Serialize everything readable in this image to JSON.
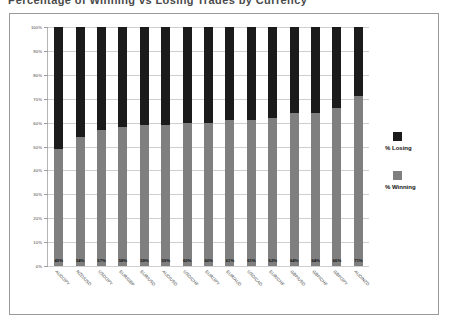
{
  "title_remnant": "Percentage of Winning vs Losing Trades by Currency Pair",
  "chart_data": {
    "type": "bar",
    "subtype": "stacked-bar-100",
    "title": "",
    "xlabel": "",
    "ylabel": "",
    "ylim": [
      0,
      100
    ],
    "grid": true,
    "legend_position": "right",
    "ytick_labels": [
      "0%",
      "10%",
      "20%",
      "30%",
      "40%",
      "50%",
      "60%",
      "70%",
      "80%",
      "90%",
      "100%"
    ],
    "ytick_values": [
      0,
      10,
      20,
      30,
      40,
      50,
      60,
      70,
      80,
      90,
      100
    ],
    "categories": [
      "AUD/JPY",
      "NZD/USD",
      "USD/JPY",
      "EUR/GBP",
      "EUR/USD",
      "AUD/USD",
      "USD/CHF",
      "EUR/JPY",
      "EUR/AUD",
      "USD/CAD",
      "EUR/CHF",
      "GBP/USD",
      "GBP/CHF",
      "GBP/JPY",
      "AUD/NZD"
    ],
    "series": [
      {
        "name": "% Winning",
        "color": "#7f7f7f",
        "values": [
          49,
          54,
          57,
          58,
          59,
          59,
          60,
          60,
          61,
          61,
          62,
          64,
          64,
          66,
          71
        ],
        "labels": [
          "49%",
          "54%",
          "57%",
          "58%",
          "59%",
          "59%",
          "60%",
          "60%",
          "61%",
          "61%",
          "62%",
          "64%",
          "64%",
          "66%",
          "71%"
        ]
      },
      {
        "name": "% Losing",
        "color": "#1b1b1b",
        "values": [
          51,
          46,
          43,
          42,
          41,
          41,
          40,
          40,
          39,
          39,
          38,
          36,
          36,
          34,
          29
        ],
        "labels": [
          "51%",
          "46%",
          "43%",
          "42%",
          "41%",
          "41%",
          "40%",
          "40%",
          "39%",
          "39%",
          "38%",
          "36%",
          "36%",
          "34%",
          "29%"
        ]
      }
    ]
  },
  "legend": {
    "items": [
      {
        "label": "% Losing",
        "color": "#1b1b1b"
      },
      {
        "label": "% Winning",
        "color": "#7f7f7f"
      }
    ]
  }
}
